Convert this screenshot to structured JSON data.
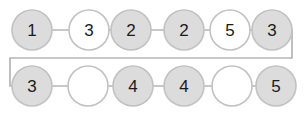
{
  "diagram": {
    "type": "linked-node-chain",
    "colors": {
      "node_fill_shaded": "#dcdcdc",
      "node_fill_empty": "#ffffff",
      "node_stroke": "#c2c2c2",
      "link_stroke": "#b5b5b5",
      "label_color": "#1a1a1a",
      "background": "#ffffff"
    },
    "geometry": {
      "node_radius": 20,
      "row_top_cy": 30,
      "row_bottom_cy": 86,
      "wrap_right_x": 292,
      "wrap_left_x": 10,
      "wrap_mid_y": 58
    },
    "rows": [
      {
        "row_name": "top-row",
        "nodes": [
          {
            "label": "1",
            "filled": true,
            "cx": 32,
            "empty": false
          },
          {
            "label": "3",
            "filled": false,
            "cx": 89,
            "empty": false
          },
          {
            "label": "2",
            "filled": true,
            "cx": 131,
            "empty": false
          },
          {
            "label": "2",
            "filled": true,
            "cx": 184,
            "empty": false
          },
          {
            "label": "5",
            "filled": false,
            "cx": 230,
            "empty": false
          },
          {
            "label": "3",
            "filled": true,
            "cx": 272,
            "empty": false
          }
        ],
        "links": [
          {
            "from_cx": 32,
            "to_cx": 89
          },
          {
            "from_cx": 89,
            "to_cx": 131
          },
          {
            "from_cx": 131,
            "to_cx": 184
          },
          {
            "from_cx": 184,
            "to_cx": 230
          },
          {
            "from_cx": 230,
            "to_cx": 272
          }
        ]
      },
      {
        "row_name": "bottom-row",
        "nodes": [
          {
            "label": "3",
            "filled": true,
            "cx": 32,
            "empty": false
          },
          {
            "label": "",
            "filled": false,
            "cx": 88,
            "empty": true
          },
          {
            "label": "4",
            "filled": true,
            "cx": 133,
            "empty": false
          },
          {
            "label": "4",
            "filled": true,
            "cx": 184,
            "empty": false
          },
          {
            "label": "",
            "filled": false,
            "cx": 232,
            "empty": true
          },
          {
            "label": "5",
            "filled": true,
            "cx": 276,
            "empty": false
          }
        ],
        "links": [
          {
            "from_cx": 32,
            "to_cx": 88
          },
          {
            "from_cx": 88,
            "to_cx": 133
          },
          {
            "from_cx": 133,
            "to_cx": 184
          },
          {
            "from_cx": 184,
            "to_cx": 232
          },
          {
            "from_cx": 232,
            "to_cx": 276
          }
        ]
      }
    ],
    "wrap_connector": {
      "name": "row-wrap-connector",
      "path": "M 272 30 L 292 30 L 292 58 L 10 58 L 10 86 L 32 86"
    },
    "corner_artifact": {
      "name": "top-left-partial-arc",
      "description": "faint clipped arc at top-left corner",
      "path": "M 7 -6 A 10 10 0 0 0 -3 8"
    }
  }
}
